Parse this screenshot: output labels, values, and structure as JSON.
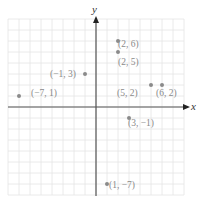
{
  "chart_data": {
    "type": "scatter",
    "title": "",
    "xlabel": "x",
    "ylabel": "y",
    "xlim": [
      -8,
      8
    ],
    "ylim": [
      -8,
      8
    ],
    "grid": true,
    "grid_step": 1,
    "points": [
      {
        "x": 2,
        "y": 6,
        "label": "(2, 6)"
      },
      {
        "x": 2,
        "y": 5,
        "label": "(2, 5)"
      },
      {
        "x": -1,
        "y": 3,
        "label": "(−1, 3)"
      },
      {
        "x": -7,
        "y": 1,
        "label": "(−7, 1)"
      },
      {
        "x": 5,
        "y": 2,
        "label": "(5, 2)"
      },
      {
        "x": 6,
        "y": 2,
        "label": "(6, 2)"
      },
      {
        "x": 3,
        "y": -1,
        "label": "(3, −1)"
      },
      {
        "x": 1,
        "y": -7,
        "label": "(1, −7)"
      }
    ]
  },
  "colors": {
    "grid": "#e4e4e4",
    "axis": "#555555",
    "point": "#8a8a8a",
    "label": "#8a8a8a"
  },
  "axes": {
    "x_label": "x",
    "y_label": "y"
  },
  "labels": {
    "p0": "(2, 6)",
    "p1": "(2, 5)",
    "p2": "(−1, 3)",
    "p3": "(−7, 1)",
    "p4": "(5, 2)",
    "p5": "(6, 2)",
    "p6": "(3, −1)",
    "p7": "(1, −7)"
  }
}
